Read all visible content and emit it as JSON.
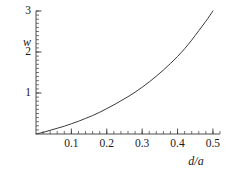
{
  "chart_data": {
    "type": "line",
    "title": "",
    "xlabel": "d/a",
    "ylabel": "w",
    "xlim": [
      0.0,
      0.52
    ],
    "ylim": [
      0.0,
      3.0
    ],
    "grid": false,
    "legend": null,
    "x_ticks": [
      {
        "value": 0.1,
        "label": "0.1"
      },
      {
        "value": 0.2,
        "label": "0.2"
      },
      {
        "value": 0.3,
        "label": "0.3"
      },
      {
        "value": 0.4,
        "label": "0.4"
      },
      {
        "value": 0.5,
        "label": "0.5"
      }
    ],
    "x_minor_tick_step": 0.02,
    "y_ticks": [
      {
        "value": 1,
        "label": "1"
      },
      {
        "value": 2,
        "label": "2"
      },
      {
        "value": 3,
        "label": "3"
      }
    ],
    "y_minor_tick_step": 0.1,
    "series": [
      {
        "name": "w(d/a)",
        "color": "#3a3a3a",
        "x": [
          0.0,
          0.02,
          0.04,
          0.06,
          0.08,
          0.1,
          0.12,
          0.14,
          0.16,
          0.18,
          0.2,
          0.22,
          0.24,
          0.26,
          0.28,
          0.3,
          0.32,
          0.34,
          0.36,
          0.38,
          0.4,
          0.42,
          0.44,
          0.46,
          0.48,
          0.5
        ],
        "values": [
          0.0,
          0.04,
          0.09,
          0.14,
          0.19,
          0.25,
          0.31,
          0.38,
          0.45,
          0.53,
          0.62,
          0.71,
          0.81,
          0.91,
          1.02,
          1.14,
          1.27,
          1.41,
          1.56,
          1.72,
          1.89,
          2.08,
          2.29,
          2.52,
          2.75,
          3.0
        ]
      }
    ]
  },
  "axes": {
    "y_axis_name": "w-axis",
    "x_axis_name": "d-over-a-axis"
  }
}
